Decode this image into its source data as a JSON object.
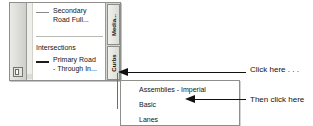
{
  "palette": {
    "title": "Tool Palettes - Civil 3...",
    "properties_icon": "properties-icon",
    "scroll_gutter": "scrollbar-gutter",
    "tabs": [
      {
        "label": "Media..."
      },
      {
        "label": "Curbs"
      }
    ],
    "group_header": "Intersections",
    "tools": [
      {
        "label": "Secondary\nRoad Full...",
        "swatch": "thin-line-swatch"
      },
      {
        "label": "Primary Road\n- Through In...",
        "swatch": "thick-line-swatch"
      }
    ]
  },
  "flyout_menu": {
    "items": [
      {
        "label": "Assemblies - Imperial"
      },
      {
        "label": "Basic"
      },
      {
        "label": "Lanes"
      }
    ]
  },
  "annotations": [
    {
      "text": "Click here . . .",
      "arrow": "left-arrow-icon"
    },
    {
      "text": "Then click here",
      "arrow": "left-arrow-icon"
    }
  ],
  "colors": {
    "ink": "#111111",
    "palette_chrome": "#dededa",
    "menu_background": "#ffffff",
    "border": "#8e8e8a"
  }
}
